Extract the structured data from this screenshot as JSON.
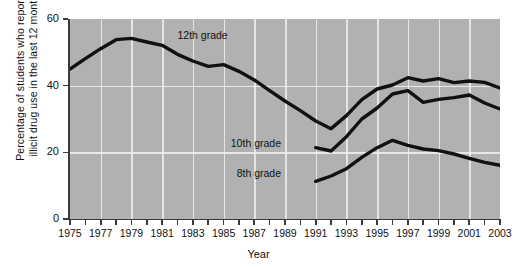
{
  "chart_data": {
    "type": "line",
    "title": "",
    "xlabel": "Year",
    "ylabel": "Percentage of students who reported illicit drug use in the last 12 months",
    "ylabel_lines": [
      "Percentage of students who reported",
      "illicit drug use in the last 12 months"
    ],
    "xlim": [
      1975,
      2003
    ],
    "ylim": [
      0,
      60
    ],
    "yticks": [
      0,
      20,
      40,
      60
    ],
    "ytick_labels": [
      "0",
      "20",
      "40",
      "60"
    ],
    "xticks": [
      1975,
      1976,
      1977,
      1978,
      1979,
      1980,
      1981,
      1982,
      1983,
      1984,
      1985,
      1986,
      1987,
      1988,
      1989,
      1990,
      1991,
      1992,
      1993,
      1994,
      1995,
      1996,
      1997,
      1998,
      1999,
      2000,
      2001,
      2002,
      2003
    ],
    "xtick_labels": [
      "1975",
      "",
      "1977",
      "",
      "1979",
      "",
      "1981",
      "",
      "1983",
      "",
      "1985",
      "",
      "1987",
      "",
      "1989",
      "",
      "1991",
      "",
      "1993",
      "",
      "1995",
      "",
      "1997",
      "",
      "1999",
      "",
      "2001",
      "",
      "2003"
    ],
    "grid": true,
    "grid_color": "#efefef",
    "plot_background": "#b1b1b1",
    "line_color": "#111111",
    "legend_position": "inline-annotations",
    "series": [
      {
        "name": "12th grade",
        "label": "12th grade",
        "label_x": 1982,
        "label_y": 55,
        "x": [
          1975,
          1976,
          1977,
          1978,
          1979,
          1980,
          1981,
          1982,
          1983,
          1984,
          1985,
          1986,
          1987,
          1988,
          1989,
          1990,
          1991,
          1992,
          1993,
          1994,
          1995,
          1996,
          1997,
          1998,
          1999,
          2000,
          2001,
          2002,
          2003
        ],
        "values": [
          45.0,
          48.1,
          51.1,
          53.8,
          54.2,
          53.1,
          52.1,
          49.4,
          47.4,
          45.8,
          46.3,
          44.3,
          41.7,
          38.5,
          35.4,
          32.5,
          29.4,
          27.1,
          31.0,
          35.8,
          39.0,
          40.2,
          42.4,
          41.4,
          42.1,
          40.9,
          41.4,
          41.0,
          39.3
        ]
      },
      {
        "name": "10th grade",
        "label": "10th grade",
        "label_x": 1989,
        "label_y": 22.5,
        "x": [
          1991,
          1992,
          1993,
          1994,
          1995,
          1996,
          1997,
          1998,
          1999,
          2000,
          2001,
          2002,
          2003
        ],
        "values": [
          21.4,
          20.4,
          24.7,
          30.0,
          33.3,
          37.5,
          38.5,
          35.0,
          35.9,
          36.4,
          37.2,
          34.8,
          33.0
        ]
      },
      {
        "name": "8th grade",
        "label": "8th grade",
        "label_x": 1989,
        "label_y": 13.5,
        "x": [
          1991,
          1992,
          1993,
          1994,
          1995,
          1996,
          1997,
          1998,
          1999,
          2000,
          2001,
          2002,
          2003
        ],
        "values": [
          11.3,
          12.9,
          15.1,
          18.5,
          21.4,
          23.6,
          22.1,
          21.0,
          20.5,
          19.5,
          18.2,
          17.0,
          16.1
        ]
      }
    ]
  }
}
